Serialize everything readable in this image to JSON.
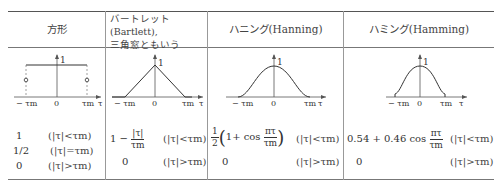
{
  "table": {
    "columns": [
      {
        "header": "方形",
        "plot_type": "rectangular",
        "axis_labels": {
          "left": "− τm",
          "center": "0",
          "right": "τm",
          "axis": "τ",
          "peak": "1"
        },
        "formulas": [
          {
            "expr": "1",
            "cond": "(|τ|<τm)"
          },
          {
            "expr": "1/2",
            "cond": "(|τ|=τm)"
          },
          {
            "expr": "0",
            "cond": "(|τ|>τm)"
          }
        ]
      },
      {
        "header_line1": "バートレット(Bartlett),",
        "header_line2": "三角窓ともいう",
        "plot_type": "triangular",
        "axis_labels": {
          "left": "− τm",
          "center": "0",
          "right": "τm",
          "axis": "τ",
          "peak": "1"
        },
        "formulas": [
          {
            "expr_prefix": "1 −",
            "frac_num": "|τ|",
            "frac_den": "τm",
            "cond": "(|τ|<τm)"
          },
          {
            "expr": "0",
            "cond": "(|τ|>τm)"
          }
        ]
      },
      {
        "header": "ハニング(Hanning)",
        "plot_type": "hanning",
        "axis_labels": {
          "left": "− τm",
          "center": "0",
          "right": "τm",
          "axis": "τ",
          "peak": "1"
        },
        "formulas": [
          {
            "coef_num": "1",
            "coef_den": "2",
            "inner": "1+ cos",
            "frac_num": "πτ",
            "frac_den": "τm",
            "cond": "(|τ|<τm)"
          },
          {
            "expr": "0",
            "cond": "(|τ|>τm)"
          }
        ]
      },
      {
        "header": "ハミング(Hamming)",
        "plot_type": "hamming",
        "axis_labels": {
          "left": "− τm",
          "center": "0",
          "right": "τm",
          "axis": "τ",
          "peak": "1"
        },
        "formulas": [
          {
            "expr_prefix": "0.54 + 0.46 cos",
            "frac_num": "πτ",
            "frac_den": "τm",
            "cond": "(|τ|<τm)"
          },
          {
            "expr": "0",
            "cond": "(|τ|>τm)"
          }
        ]
      }
    ]
  }
}
